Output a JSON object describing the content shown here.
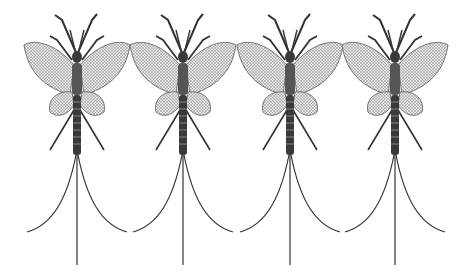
{
  "image": {
    "subject": "mayfly engravings",
    "count": 4,
    "background": "#ffffff",
    "ink": "#2a2a2a",
    "centers_x": [
      77,
      183,
      290,
      395
    ]
  }
}
